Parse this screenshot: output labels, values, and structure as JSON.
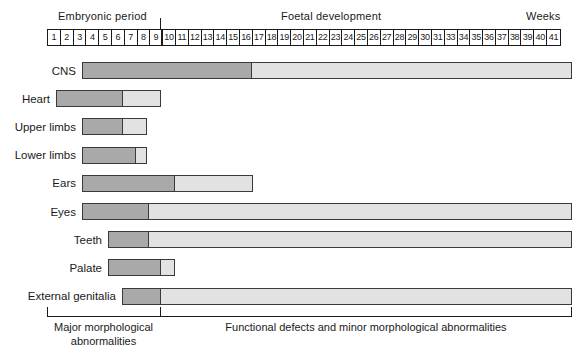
{
  "header": {
    "embryonic_label": "Embryonic period",
    "foetal_label": "Foetal development",
    "weeks_label": "Weeks"
  },
  "footer": {
    "major_label": "Major morphological abnormalities",
    "functional_label": "Functional defects and minor morphological abnormalities"
  },
  "colors": {
    "major_abnormality": "#a9a9a9",
    "minor_abnormality": "#e2e2e2",
    "outline": "#3a3a3a",
    "text": "#1a1a1a"
  },
  "chart_data": {
    "type": "bar",
    "xlabel": "Weeks",
    "ylabel": "",
    "grid": false,
    "legend_position": "bottom",
    "axis_ticks": [
      "1",
      "2",
      "3",
      "4",
      "5",
      "6",
      "7",
      "8",
      "9",
      "10",
      "11",
      "12",
      "13",
      "14",
      "15",
      "16",
      "17",
      "18",
      "19",
      "20",
      "21",
      "22",
      "23",
      "24",
      "25",
      "26",
      "27",
      "28",
      "29",
      "30",
      "31",
      "33",
      "34",
      "35",
      "36",
      "37",
      "38",
      "39",
      "40",
      "41"
    ],
    "period_boundary_week": 9,
    "legend": [
      {
        "name": "Major morphological abnormalities",
        "color": "#a9a9a9"
      },
      {
        "name": "Functional defects and minor morphological abnormalities",
        "color": "#e2e2e2"
      }
    ],
    "categories": [
      "CNS",
      "Heart",
      "Upper limbs",
      "Lower limbs",
      "Ears",
      "Eyes",
      "Teeth",
      "Palate",
      "External genitalia"
    ],
    "series": [
      {
        "name": "Major morphological abnormalities",
        "start_weeks": [
          3,
          3.5,
          4.5,
          4.5,
          4.5,
          4.5,
          6.5,
          6.5,
          7
        ],
        "end_weeks": [
          17,
          9,
          9,
          10,
          13,
          11,
          11,
          12,
          12
        ]
      },
      {
        "name": "Functional defects and minor morphological abnormalities",
        "start_weeks": [
          17,
          9,
          9,
          10,
          13,
          11,
          11,
          12,
          12
        ],
        "end_weeks": [
          42,
          12,
          11,
          11,
          19,
          42,
          42,
          13,
          42
        ]
      }
    ],
    "rows": [
      {
        "label": "CNS",
        "start_px": 82,
        "split_px": 251,
        "end_px": 572
      },
      {
        "label": "Heart",
        "start_px": 56,
        "split_px": 122,
        "end_px": 161
      },
      {
        "label": "Upper limbs",
        "start_px": 82,
        "split_px": 122,
        "end_px": 147
      },
      {
        "label": "Lower limbs",
        "start_px": 82,
        "split_px": 135,
        "end_px": 147
      },
      {
        "label": "Ears",
        "start_px": 82,
        "split_px": 174,
        "end_px": 253
      },
      {
        "label": "Eyes",
        "start_px": 82,
        "split_px": 148,
        "end_px": 572
      },
      {
        "label": "Teeth",
        "start_px": 108,
        "split_px": 148,
        "end_px": 572
      },
      {
        "label": "Palate",
        "start_px": 108,
        "split_px": 160,
        "end_px": 175
      },
      {
        "label": "External genitalia",
        "start_px": 122,
        "split_px": 160,
        "end_px": 572
      }
    ]
  }
}
